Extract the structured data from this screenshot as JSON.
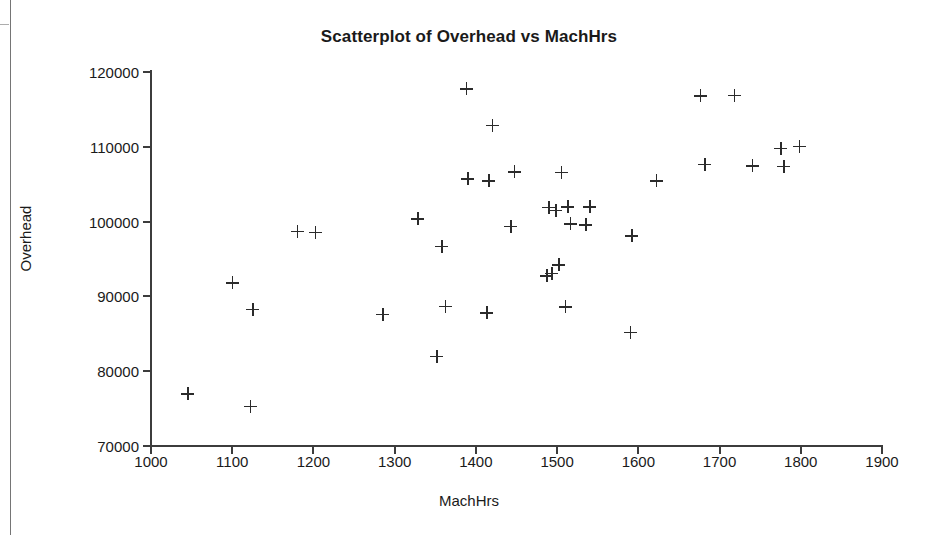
{
  "chart_data": {
    "type": "scatter",
    "title": "Scatterplot of Overhead vs MachHrs",
    "xlabel": "MachHrs",
    "ylabel": "Overhead",
    "xlim": [
      1000,
      1900
    ],
    "ylim": [
      70000,
      120000
    ],
    "xticks": [
      1000,
      1100,
      1200,
      1300,
      1400,
      1500,
      1600,
      1700,
      1800,
      1900
    ],
    "yticks": [
      70000,
      80000,
      90000,
      100000,
      110000,
      120000
    ],
    "grid": false,
    "legend": false,
    "marker": "plus",
    "marker_color": "#2b2b2b",
    "x": [
      1045,
      1100,
      1122,
      1125,
      1180,
      1202,
      1285,
      1328,
      1352,
      1358,
      1362,
      1388,
      1390,
      1413,
      1416,
      1420,
      1443,
      1447,
      1487,
      1490,
      1493,
      1498,
      1502,
      1505,
      1510,
      1513,
      1516,
      1535,
      1540,
      1590,
      1592,
      1622,
      1676,
      1682,
      1718,
      1740,
      1775,
      1779,
      1798
    ],
    "y": [
      77000,
      91800,
      75300,
      88300,
      98700,
      98600,
      87600,
      100400,
      82000,
      96700,
      88700,
      117800,
      105700,
      87800,
      105500,
      112900,
      99400,
      106700,
      92800,
      101900,
      93100,
      101500,
      94200,
      106600,
      88600,
      102000,
      99700,
      99600,
      102000,
      85200,
      98100,
      105500,
      116800,
      107700,
      116900,
      107500,
      109800,
      107400,
      110100
    ]
  }
}
